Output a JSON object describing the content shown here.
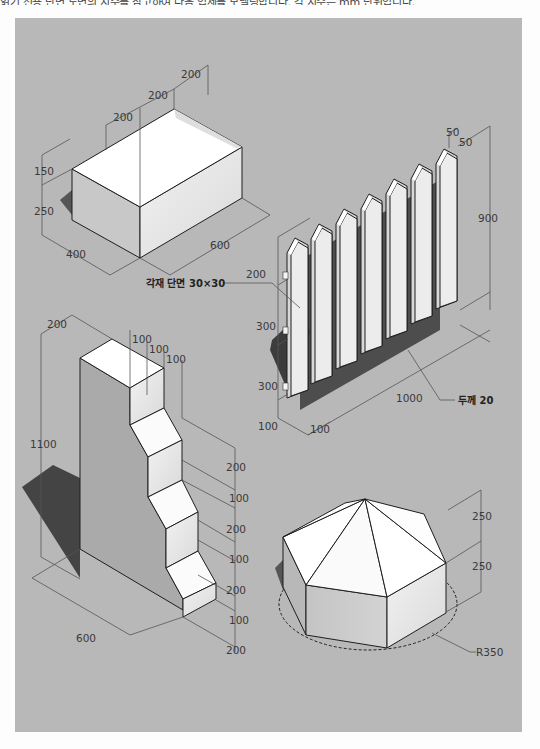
{
  "header": {
    "cutoff_text": "읽기 전용 단면 도면의 치수를 참고하여 다음 입체를 모델링합니다. 각 치수는 mm 단위입니다."
  },
  "figures": {
    "box": {
      "name": "hip-roof box",
      "dims": {
        "top1": "200",
        "top2": "200",
        "top3": "200",
        "roof_h": "150",
        "wall_h": "250",
        "depth": "400",
        "width": "600"
      }
    },
    "fence": {
      "name": "picket fence",
      "dims": {
        "tip_a": "50",
        "tip_b": "50",
        "height": "900",
        "rail1": "200",
        "rail2": "300",
        "rail3": "300",
        "base": "100",
        "thick_x": "100",
        "length": "1000"
      },
      "callouts": {
        "rail_section": "각재 단면 30×30",
        "thickness": "두께 20"
      }
    },
    "stairs": {
      "name": "stepped block",
      "dims": {
        "top_w": "200",
        "s1": "100",
        "s2": "100",
        "s3": "100",
        "height": "1100",
        "r1": "200",
        "r2": "100",
        "r3": "200",
        "r4": "100",
        "r5": "200",
        "r6": "100",
        "r7": "200",
        "length": "600"
      }
    },
    "octagon": {
      "name": "octagonal pyramid-topped prism",
      "dims": {
        "roof_h": "250",
        "wall_h": "250",
        "radius": "R350"
      }
    }
  }
}
